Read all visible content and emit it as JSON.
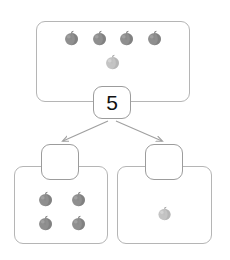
{
  "worksheet": {
    "type": "part-part-whole number bond",
    "subject": "apples"
  },
  "whole": {
    "label": "whole-group-box",
    "total_value": "5",
    "apple_count": 5,
    "apples": [
      {
        "name": "apple-1",
        "x": 63,
        "y": 30,
        "shade": "dark",
        "size": "normal"
      },
      {
        "name": "apple-2",
        "x": 91,
        "y": 30,
        "shade": "dark",
        "size": "normal"
      },
      {
        "name": "apple-3",
        "x": 118,
        "y": 30,
        "shade": "dark",
        "size": "normal"
      },
      {
        "name": "apple-4",
        "x": 146,
        "y": 30,
        "shade": "dark",
        "size": "normal"
      },
      {
        "name": "apple-5",
        "x": 104,
        "y": 54,
        "shade": "light",
        "size": "normal"
      }
    ]
  },
  "parts": [
    {
      "name": "part-left",
      "answer_value": "",
      "answer_placeholder": "",
      "apple_count": 4,
      "apples": [
        {
          "name": "apple-1",
          "x": 37,
          "y": 191,
          "shade": "dark",
          "size": "normal"
        },
        {
          "name": "apple-2",
          "x": 70,
          "y": 191,
          "shade": "dark",
          "size": "normal"
        },
        {
          "name": "apple-3",
          "x": 37,
          "y": 215,
          "shade": "dark",
          "size": "normal"
        },
        {
          "name": "apple-4",
          "x": 70,
          "y": 215,
          "shade": "dark",
          "size": "normal"
        }
      ]
    },
    {
      "name": "part-right",
      "answer_value": "",
      "answer_placeholder": "",
      "apple_count": 1,
      "apples": [
        {
          "name": "apple-1",
          "x": 157,
          "y": 206,
          "shade": "light",
          "size": "small"
        }
      ]
    }
  ],
  "arrows": [
    {
      "name": "arrow-to-left-part",
      "from_x": 108,
      "from_y": 121,
      "to_x": 62,
      "to_y": 142
    },
    {
      "name": "arrow-to-right-part",
      "from_x": 116,
      "from_y": 121,
      "to_x": 163,
      "to_y": 142
    }
  ],
  "colors": {
    "box_border": "#b5b5b5",
    "bubble_border": "#9c9c9c",
    "arrow": "#a0a0a0",
    "background": "#ffffff",
    "apple_dark": "#8d8d8d",
    "apple_light": "#bcbcbc",
    "number_text": "#111111"
  }
}
